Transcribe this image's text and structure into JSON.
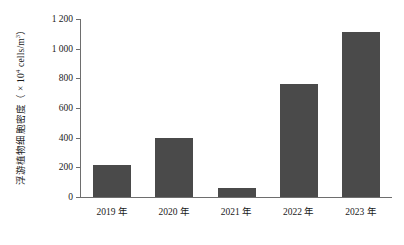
{
  "chart_data": {
    "type": "bar",
    "title": "",
    "xlabel": "",
    "ylabel": "浮游植物细胞密度（× 10⁴ cells/m³）",
    "ylabel_parts": {
      "prefix": "浮游植物细胞密度（ × 10",
      "exponent": "4",
      "suffix": " cells/m",
      "exponent2": "3",
      "tail": "）"
    },
    "categories": [
      "2019 年",
      "2020 年",
      "2021 年",
      "2022 年",
      "2023 年"
    ],
    "values": [
      215,
      400,
      62,
      760,
      1115
    ],
    "ylim": [
      0,
      1200
    ],
    "ytick_values": [
      0,
      200,
      400,
      600,
      800,
      1000,
      1200
    ],
    "ytick_labels": [
      "0",
      "200",
      "400",
      "600",
      "800",
      "1 000",
      "1 200"
    ],
    "grid": false,
    "legend": null,
    "series": [
      {
        "name": "浮游植物细胞密度",
        "values": [
          215,
          400,
          62,
          760,
          1115
        ]
      }
    ],
    "colors": {
      "bar": "#4a4a4a",
      "axis": "#6e6e6e",
      "text": "#1a1a1a",
      "background": "#ffffff"
    }
  }
}
